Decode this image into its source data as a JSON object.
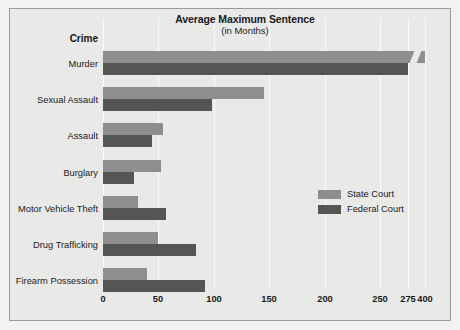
{
  "chart_data": {
    "type": "bar",
    "orientation": "horizontal",
    "title": "Average Maximum Sentence",
    "subtitle": "(in Months)",
    "category_axis_title": "Crime",
    "xlabel": "",
    "ylabel": "Crime",
    "categories": [
      "Murder",
      "Sexual Assault",
      "Assault",
      "Burglary",
      "Motor Vehicle Theft",
      "Drug Trafficking",
      "Firearm Possession"
    ],
    "series": [
      {
        "name": "State Court",
        "color": "#8e8e8e",
        "values": [
          400,
          145,
          54,
          52,
          32,
          50,
          40
        ]
      },
      {
        "name": "Federal Court",
        "color": "#555555",
        "values": [
          275,
          98,
          44,
          28,
          57,
          84,
          92
        ]
      }
    ],
    "xticks": [
      "0",
      "50",
      "100",
      "150",
      "200",
      "250",
      "275",
      "400"
    ],
    "xtick_values": [
      0,
      50,
      100,
      150,
      200,
      250,
      275,
      400
    ],
    "xlim": [
      0,
      400
    ],
    "axis_break": {
      "present": true,
      "between": [
        275,
        400
      ],
      "note": "axis compressed between 275 and 400; State Court Murder bar drawn with break symbol"
    },
    "grid": true,
    "legend_position": "middle-right",
    "legend": [
      {
        "label": "State Court",
        "color": "#8e8e8e"
      },
      {
        "label": "Federal Court",
        "color": "#555555"
      }
    ]
  },
  "colors": {
    "panel_background": "#e9e9e8",
    "page_background": "#f2f2f1",
    "panel_border": "#9a9a9a",
    "gridline": "#fafafa",
    "text": "#1b1b1b",
    "state_court": "#8e8e8e",
    "federal_court": "#555555"
  }
}
